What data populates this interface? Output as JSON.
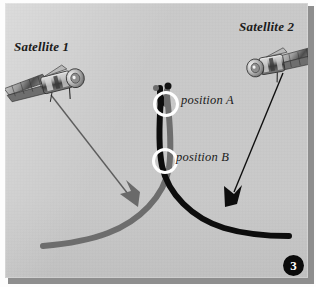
{
  "figure": {
    "number_badge": "3",
    "background_color": "#c9c9c9",
    "accent_black": "#0d0d0d",
    "accent_gray": "#6d6d6d"
  },
  "labels": {
    "satellite_1": "Satellite 1",
    "satellite_2": "Satellite 2",
    "position_a": "position A",
    "position_b": "position B"
  },
  "icons": {
    "satellite_1": "satellite-icon",
    "satellite_2": "satellite-icon"
  },
  "diagram": {
    "curves": [
      {
        "name": "gray-trajectory",
        "color": "#6d6d6d",
        "width": 6
      },
      {
        "name": "black-trajectory",
        "color": "#0d0d0d",
        "width": 6
      }
    ],
    "pointers": [
      {
        "name": "satellite-1-pointer",
        "color": "#6d6d6d",
        "from": "Satellite 1",
        "to": "gray-trajectory"
      },
      {
        "name": "satellite-2-pointer",
        "color": "#0d0d0d",
        "from": "Satellite 2",
        "to": "black-trajectory"
      }
    ],
    "markers": [
      {
        "name": "position-a-marker",
        "label": "position A",
        "ring_color": "#ffffff",
        "cx": 166,
        "cy": 104
      },
      {
        "name": "position-b-marker",
        "label": "position B",
        "ring_color": "#ffffff",
        "cx": 165,
        "cy": 161
      }
    ]
  }
}
